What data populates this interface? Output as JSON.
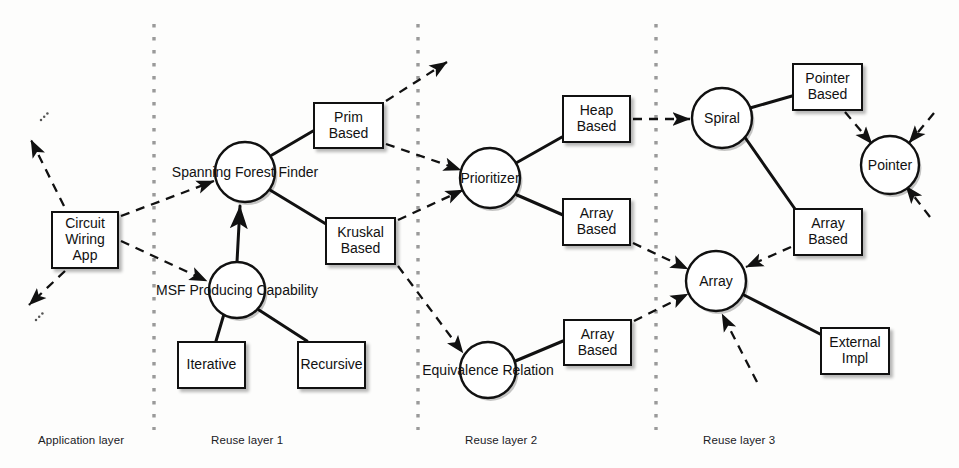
{
  "diagram": {
    "colors": {
      "stroke": "#111111",
      "background": "#fdfdfc",
      "divider": "#9a9a9a",
      "shadow": "rgba(0,0,0,0.28)"
    },
    "layer_labels": [
      {
        "id": "application-layer",
        "text": "Application layer",
        "x": 38,
        "y": 434
      },
      {
        "id": "reuse-layer-1",
        "text": "Reuse layer 1",
        "x": 211,
        "y": 434
      },
      {
        "id": "reuse-layer-2",
        "text": "Reuse layer 2",
        "x": 465,
        "y": 434
      },
      {
        "id": "reuse-layer-3",
        "text": "Reuse layer 3",
        "x": 703,
        "y": 434
      }
    ],
    "dividers": [
      {
        "id": "divider-1",
        "x": 154
      },
      {
        "id": "divider-2",
        "x": 418
      },
      {
        "id": "divider-3",
        "x": 656
      }
    ],
    "circles": [
      {
        "id": "spanning-forest-finder",
        "label": "Spanning Forest Finder",
        "cx": 245,
        "cy": 172,
        "r": 30
      },
      {
        "id": "msf-producing-capability",
        "label": "MSF Producing Capability",
        "cx": 237,
        "cy": 290,
        "r": 28
      },
      {
        "id": "prioritizer",
        "label": "Prioritizer",
        "cx": 490,
        "cy": 178,
        "r": 30
      },
      {
        "id": "equivalence-relation",
        "label": "Equivalence Relation",
        "cx": 488,
        "cy": 370,
        "r": 28
      },
      {
        "id": "spiral",
        "label": "Spiral",
        "cx": 722,
        "cy": 118,
        "r": 30
      },
      {
        "id": "pointer",
        "label": "Pointer",
        "cx": 890,
        "cy": 165,
        "r": 29
      },
      {
        "id": "array",
        "label": "Array",
        "cx": 716,
        "cy": 281,
        "r": 30
      }
    ],
    "boxes": [
      {
        "id": "circuit-wiring-app",
        "lines": [
          "Circuit",
          "Wiring",
          "App"
        ],
        "x": 51,
        "y": 211,
        "w": 68,
        "h": 58
      },
      {
        "id": "prim-based",
        "lines": [
          "Prim",
          "Based"
        ],
        "x": 313,
        "y": 102,
        "w": 71,
        "h": 47
      },
      {
        "id": "kruskal-based",
        "lines": [
          "Kruskal",
          "Based"
        ],
        "x": 325,
        "y": 217,
        "w": 71,
        "h": 48
      },
      {
        "id": "iterative",
        "lines": [
          "Iterative"
        ],
        "x": 177,
        "y": 341,
        "w": 69,
        "h": 48
      },
      {
        "id": "recursive",
        "lines": [
          "Recursive"
        ],
        "x": 297,
        "y": 341,
        "w": 69,
        "h": 48
      },
      {
        "id": "heap-based",
        "lines": [
          "Heap",
          "Based"
        ],
        "x": 562,
        "y": 95,
        "w": 69,
        "h": 48
      },
      {
        "id": "array-based-prioritizer",
        "lines": [
          "Array",
          "Based"
        ],
        "x": 562,
        "y": 198,
        "w": 69,
        "h": 48
      },
      {
        "id": "array-based-equivalence",
        "lines": [
          "Array",
          "Based"
        ],
        "x": 563,
        "y": 319,
        "w": 69,
        "h": 47
      },
      {
        "id": "pointer-based",
        "lines": [
          "Pointer",
          "Based"
        ],
        "x": 792,
        "y": 63,
        "w": 71,
        "h": 48
      },
      {
        "id": "array-based-spiral",
        "lines": [
          "Array",
          "Based"
        ],
        "x": 793,
        "y": 208,
        "w": 70,
        "h": 48
      },
      {
        "id": "external-impl",
        "lines": [
          "External",
          "Impl"
        ],
        "x": 820,
        "y": 327,
        "w": 70,
        "h": 48
      }
    ],
    "solid_edges": [
      {
        "id": "edge-sff-prim",
        "x1": 272,
        "y1": 155,
        "x2": 313,
        "y2": 131
      },
      {
        "id": "edge-sff-kruskal",
        "x1": 270,
        "y1": 190,
        "x2": 326,
        "y2": 224
      },
      {
        "id": "edge-msf-sff",
        "x1": 237,
        "y1": 262,
        "x2": 240,
        "y2": 206,
        "arrow": true
      },
      {
        "id": "edge-msf-iterative",
        "x1": 224,
        "y1": 314,
        "x2": 216,
        "y2": 341
      },
      {
        "id": "edge-msf-recursive",
        "x1": 259,
        "y1": 310,
        "x2": 307,
        "y2": 341
      },
      {
        "id": "edge-prioritizer-heap",
        "x1": 516,
        "y1": 163,
        "x2": 562,
        "y2": 137
      },
      {
        "id": "edge-prioritizer-array",
        "x1": 517,
        "y1": 195,
        "x2": 563,
        "y2": 215
      },
      {
        "id": "edge-equivalence-array",
        "x1": 513,
        "y1": 362,
        "x2": 563,
        "y2": 341
      },
      {
        "id": "edge-spiral-pointerbased",
        "x1": 750,
        "y1": 108,
        "x2": 792,
        "y2": 96
      },
      {
        "id": "edge-spiral-arraybased",
        "x1": 744,
        "y1": 136,
        "x2": 795,
        "y2": 209
      },
      {
        "id": "edge-array-external",
        "x1": 742,
        "y1": 294,
        "x2": 820,
        "y2": 334
      }
    ],
    "dashed_edges": [
      {
        "id": "dash-app-upleft",
        "x1": 64,
        "y1": 206,
        "x2": 31,
        "y2": 140,
        "arrow": true
      },
      {
        "id": "dash-app-downleft",
        "x1": 65,
        "y1": 271,
        "x2": 29,
        "y2": 305,
        "arrow": true
      },
      {
        "id": "dash-app-sff",
        "x1": 121,
        "y1": 216,
        "x2": 214,
        "y2": 181,
        "arrow": true
      },
      {
        "id": "dash-app-msf",
        "x1": 121,
        "y1": 241,
        "x2": 207,
        "y2": 281,
        "arrow": true
      },
      {
        "id": "dash-prim-upright",
        "x1": 386,
        "y1": 101,
        "x2": 447,
        "y2": 62,
        "arrow": true
      },
      {
        "id": "dash-prim-prioritizer",
        "x1": 386,
        "y1": 144,
        "x2": 461,
        "y2": 170,
        "arrow": true
      },
      {
        "id": "dash-kruskal-prioritizer",
        "x1": 398,
        "y1": 220,
        "x2": 463,
        "y2": 190,
        "arrow": true
      },
      {
        "id": "dash-kruskal-equivalence",
        "x1": 398,
        "y1": 266,
        "x2": 463,
        "y2": 353,
        "arrow": true
      },
      {
        "id": "dash-heap-spiral",
        "x1": 633,
        "y1": 119,
        "x2": 690,
        "y2": 119,
        "arrow": true
      },
      {
        "id": "dash-array2-array3",
        "x1": 633,
        "y1": 243,
        "x2": 688,
        "y2": 269,
        "arrow": true
      },
      {
        "id": "dash-array2eq-array3",
        "x1": 634,
        "y1": 321,
        "x2": 688,
        "y2": 294,
        "arrow": true
      },
      {
        "id": "dash-pointerbased-pointer",
        "x1": 845,
        "y1": 112,
        "x2": 872,
        "y2": 144,
        "arrow": true
      },
      {
        "id": "dash-pointer-upright",
        "x1": 934,
        "y1": 113,
        "x2": 909,
        "y2": 143,
        "arrow": true
      },
      {
        "id": "dash-pointer-downright",
        "x1": 930,
        "y1": 217,
        "x2": 906,
        "y2": 186,
        "arrow": true
      },
      {
        "id": "dash-arraybased3-array",
        "x1": 791,
        "y1": 247,
        "x2": 746,
        "y2": 267,
        "arrow": true
      },
      {
        "id": "dash-below-array",
        "x1": 757,
        "y1": 382,
        "x2": 722,
        "y2": 314,
        "arrow": true
      }
    ],
    "ellipsis_marks": [
      {
        "id": "ellipsis-top-left",
        "x": 41,
        "y": 120
      },
      {
        "id": "ellipsis-bottom-left",
        "x": 36,
        "y": 320
      }
    ]
  }
}
